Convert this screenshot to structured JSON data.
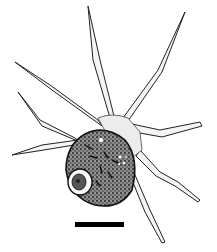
{
  "figure": {
    "colors": {
      "background": "#ffffff",
      "ink": "#111111",
      "cytoplasm": "#f2f2f2",
      "body_fill": "#6a6a6a",
      "scale_bar": "#000000"
    },
    "scale_bar": {
      "x": 75,
      "y": 222,
      "width": 49,
      "height": 5
    }
  }
}
